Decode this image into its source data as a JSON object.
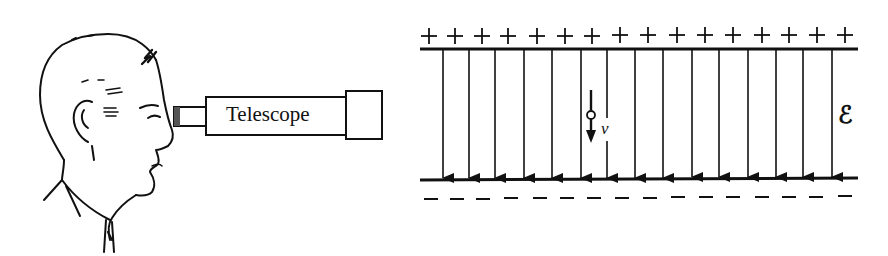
{
  "figure": {
    "type": "physics-diagram",
    "left_panel": {
      "subject": "observer-profile",
      "instrument_label": "Telescope"
    },
    "right_panel": {
      "top_plate_charge_symbol": "+",
      "top_plate_charge_count": 16,
      "bottom_plate_charge_symbol": "–",
      "bottom_plate_charge_count": 16,
      "field_line_count": 15,
      "field_direction": "downward",
      "field_label": "ℰ",
      "drop_velocity_label": "v",
      "drop_velocity_direction": "downward"
    }
  },
  "colors": {
    "ink": "#111111",
    "background": "#ffffff"
  }
}
